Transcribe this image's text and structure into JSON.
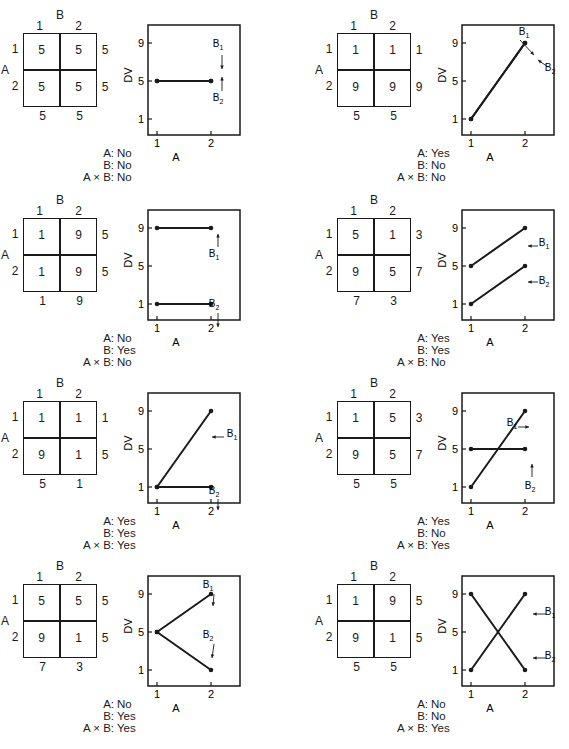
{
  "chart_data": [
    {
      "type": "line",
      "id": 1,
      "title": "",
      "table": {
        "factor_row": "A",
        "factor_col": "B",
        "col_levels": [
          "1",
          "2"
        ],
        "row_levels": [
          "1",
          "2"
        ],
        "cells": [
          [
            "5",
            "5"
          ],
          [
            "5",
            "5"
          ]
        ],
        "row_means": [
          "5",
          "5"
        ],
        "col_means": [
          "5",
          "5"
        ]
      },
      "xlabel": "A",
      "ylabel": "DV",
      "x": [
        "1",
        "2"
      ],
      "yticks": [
        "1",
        "5",
        "9"
      ],
      "ylim": [
        0,
        11
      ],
      "series": [
        {
          "name": "B1",
          "values": [
            5,
            5
          ]
        },
        {
          "name": "B2",
          "values": [
            5,
            5
          ]
        }
      ],
      "legend_labels": [
        "B",
        "1",
        "B",
        "2"
      ],
      "significance": {
        "A": "No",
        "B": "No",
        "AxB": "No"
      }
    },
    {
      "type": "line",
      "id": 2,
      "table": {
        "factor_row": "A",
        "factor_col": "B",
        "col_levels": [
          "1",
          "2"
        ],
        "row_levels": [
          "1",
          "2"
        ],
        "cells": [
          [
            "1",
            "1"
          ],
          [
            "9",
            "9"
          ]
        ],
        "row_means": [
          "1",
          "9"
        ],
        "col_means": [
          "5",
          "5"
        ]
      },
      "xlabel": "A",
      "ylabel": "DV",
      "x": [
        "1",
        "2"
      ],
      "yticks": [
        "1",
        "5",
        "9"
      ],
      "ylim": [
        0,
        11
      ],
      "series": [
        {
          "name": "B1",
          "values": [
            1,
            9
          ]
        },
        {
          "name": "B2",
          "values": [
            1,
            9
          ]
        }
      ],
      "significance": {
        "A": "Yes",
        "B": "No",
        "AxB": "No"
      }
    },
    {
      "type": "line",
      "id": 3,
      "table": {
        "factor_row": "A",
        "factor_col": "B",
        "col_levels": [
          "1",
          "2"
        ],
        "row_levels": [
          "1",
          "2"
        ],
        "cells": [
          [
            "1",
            "9"
          ],
          [
            "1",
            "9"
          ]
        ],
        "row_means": [
          "5",
          "5"
        ],
        "col_means": [
          "1",
          "9"
        ]
      },
      "xlabel": "A",
      "ylabel": "DV",
      "x": [
        "1",
        "2"
      ],
      "yticks": [
        "1",
        "5",
        "9"
      ],
      "ylim": [
        0,
        11
      ],
      "series": [
        {
          "name": "B1",
          "values": [
            9,
            9
          ]
        },
        {
          "name": "B2",
          "values": [
            1,
            1
          ]
        }
      ],
      "significance": {
        "A": "No",
        "B": "Yes",
        "AxB": "No"
      }
    },
    {
      "type": "line",
      "id": 4,
      "table": {
        "factor_row": "A",
        "factor_col": "B",
        "col_levels": [
          "1",
          "2"
        ],
        "row_levels": [
          "1",
          "2"
        ],
        "cells": [
          [
            "5",
            "1"
          ],
          [
            "9",
            "5"
          ]
        ],
        "row_means": [
          "3",
          "7"
        ],
        "col_means": [
          "7",
          "3"
        ]
      },
      "xlabel": "A",
      "ylabel": "DV",
      "x": [
        "1",
        "2"
      ],
      "yticks": [
        "1",
        "5",
        "9"
      ],
      "ylim": [
        0,
        11
      ],
      "series": [
        {
          "name": "B1",
          "values": [
            5,
            9
          ]
        },
        {
          "name": "B2",
          "values": [
            1,
            5
          ]
        }
      ],
      "significance": {
        "A": "Yes",
        "B": "Yes",
        "AxB": "No"
      }
    },
    {
      "type": "line",
      "id": 5,
      "table": {
        "factor_row": "A",
        "factor_col": "B",
        "col_levels": [
          "1",
          "2"
        ],
        "row_levels": [
          "1",
          "2"
        ],
        "cells": [
          [
            "1",
            "1"
          ],
          [
            "9",
            "1"
          ]
        ],
        "row_means": [
          "1",
          "5"
        ],
        "col_means": [
          "5",
          "1"
        ]
      },
      "xlabel": "A",
      "ylabel": "DV",
      "x": [
        "1",
        "2"
      ],
      "yticks": [
        "1",
        "5",
        "9"
      ],
      "ylim": [
        0,
        11
      ],
      "series": [
        {
          "name": "B1",
          "values": [
            1,
            9
          ]
        },
        {
          "name": "B2",
          "values": [
            1,
            1
          ]
        }
      ],
      "significance": {
        "A": "Yes",
        "B": "Yes",
        "AxB": "Yes"
      }
    },
    {
      "type": "line",
      "id": 6,
      "table": {
        "factor_row": "A",
        "factor_col": "B",
        "col_levels": [
          "1",
          "2"
        ],
        "row_levels": [
          "1",
          "2"
        ],
        "cells": [
          [
            "1",
            "5"
          ],
          [
            "9",
            "5"
          ]
        ],
        "row_means": [
          "3",
          "7"
        ],
        "col_means": [
          "5",
          "5"
        ]
      },
      "xlabel": "A",
      "ylabel": "DV",
      "x": [
        "1",
        "2"
      ],
      "yticks": [
        "1",
        "5",
        "9"
      ],
      "ylim": [
        0,
        11
      ],
      "series": [
        {
          "name": "B1",
          "values": [
            1,
            9
          ]
        },
        {
          "name": "B2",
          "values": [
            5,
            5
          ]
        }
      ],
      "significance": {
        "A": "Yes",
        "B": "No",
        "AxB": "Yes"
      }
    },
    {
      "type": "line",
      "id": 7,
      "table": {
        "factor_row": "A",
        "factor_col": "B",
        "col_levels": [
          "1",
          "2"
        ],
        "row_levels": [
          "1",
          "2"
        ],
        "cells": [
          [
            "5",
            "5"
          ],
          [
            "9",
            "1"
          ]
        ],
        "row_means": [
          "5",
          "5"
        ],
        "col_means": [
          "7",
          "3"
        ]
      },
      "xlabel": "A",
      "ylabel": "DV",
      "x": [
        "1",
        "2"
      ],
      "yticks": [
        "1",
        "5",
        "9"
      ],
      "ylim": [
        0,
        11
      ],
      "series": [
        {
          "name": "B1",
          "values": [
            5,
            9
          ]
        },
        {
          "name": "B2",
          "values": [
            5,
            1
          ]
        }
      ],
      "significance": {
        "A": "No",
        "B": "Yes",
        "AxB": "Yes"
      }
    },
    {
      "type": "line",
      "id": 8,
      "table": {
        "factor_row": "A",
        "factor_col": "B",
        "col_levels": [
          "1",
          "2"
        ],
        "row_levels": [
          "1",
          "2"
        ],
        "cells": [
          [
            "1",
            "9"
          ],
          [
            "9",
            "1"
          ]
        ],
        "row_means": [
          "5",
          "5"
        ],
        "col_means": [
          "5",
          "5"
        ]
      },
      "xlabel": "A",
      "ylabel": "DV",
      "x": [
        "1",
        "2"
      ],
      "yticks": [
        "1",
        "5",
        "9"
      ],
      "ylim": [
        0,
        11
      ],
      "series": [
        {
          "name": "B1",
          "values": [
            1,
            9
          ]
        },
        {
          "name": "B2",
          "values": [
            9,
            1
          ]
        }
      ],
      "significance": {
        "A": "No",
        "B": "No",
        "AxB": "Yes"
      }
    }
  ],
  "labels": {
    "sig_A": "A:",
    "sig_B": "B:",
    "sig_AxB": "A × B:"
  }
}
